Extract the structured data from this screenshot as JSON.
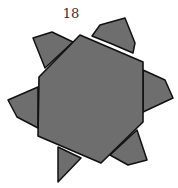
{
  "figure": {
    "label": "18",
    "fill_color": "#6e6e6e",
    "stroke_color": "#111111",
    "hexagon": {
      "points": "80,35 143,62 143,122 101,163 38,136 39,77"
    },
    "flaps": [
      {
        "name": "top-left",
        "points": "33,38 52,32 73,42 45,68"
      },
      {
        "name": "top-right",
        "points": "92,36 100,25 125,18 135,43 133,53 112,44"
      },
      {
        "name": "right",
        "points": "143,70 165,80 173,98 143,112"
      },
      {
        "name": "left",
        "points": "38,87 8,100 17,117 38,128"
      },
      {
        "name": "bottom-left-spike",
        "points": "58,147 58,182 81,158"
      },
      {
        "name": "bottom-right",
        "points": "110,155 128,165 147,160 137,130"
      }
    ]
  }
}
